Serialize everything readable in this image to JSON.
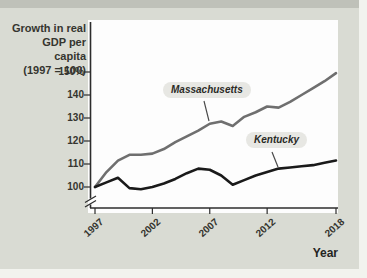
{
  "figure": {
    "y_axis_title": "Growth in real\nGDP per capita\n(1997 = 100)",
    "x_axis_title": "Year"
  },
  "colors": {
    "background": "#d9dbd3",
    "plot_background": "#fdfdfd",
    "axis": "#2d2d2d",
    "massachusetts_line": "#6f6f6f",
    "kentucky_line": "#1a1a1a",
    "label_pill_background": "#e7e7e3"
  },
  "chart_data": {
    "type": "line",
    "title": "Growth in real GDP per capita (1997 = 100)",
    "xlabel": "Year",
    "ylabel": "Growth in real GDP per capita (1997 = 100)",
    "grid": false,
    "legend": "inline-callout-labels",
    "axis_break_below_100": true,
    "ylim_shown": [
      96,
      152
    ],
    "x": [
      1997,
      1998,
      1999,
      2000,
      2001,
      2002,
      2003,
      2004,
      2005,
      2006,
      2007,
      2008,
      2009,
      2010,
      2011,
      2012,
      2013,
      2014,
      2015,
      2016,
      2017,
      2018
    ],
    "series": [
      {
        "name": "Massachusetts",
        "color": "#6f6f6f",
        "values": [
          100,
          106.5,
          111.5,
          114,
          114,
          114.5,
          116.5,
          119.5,
          122,
          124.5,
          127.5,
          128.5,
          126.5,
          130.5,
          132.5,
          135,
          134.5,
          137,
          140,
          143,
          146,
          149.5
        ]
      },
      {
        "name": "Kentucky",
        "color": "#1a1a1a",
        "values": [
          100,
          102,
          104,
          99.5,
          99,
          100,
          101.5,
          103.5,
          106,
          108,
          107.5,
          105,
          101,
          103,
          105,
          106.5,
          108,
          108.5,
          109,
          109.5,
          110.5,
          111.5
        ]
      }
    ],
    "y_ticks": [
      {
        "label": "150%",
        "value": 150
      },
      {
        "label": "140",
        "value": 140
      },
      {
        "label": "130",
        "value": 130
      },
      {
        "label": "120",
        "value": 120
      },
      {
        "label": "110",
        "value": 110
      },
      {
        "label": "100",
        "value": 100
      }
    ],
    "x_ticks": [
      {
        "label": "1997",
        "value": 1997
      },
      {
        "label": "2002",
        "value": 2002
      },
      {
        "label": "2007",
        "value": 2007
      },
      {
        "label": "2012",
        "value": 2012
      },
      {
        "label": "2018",
        "value": 2018
      }
    ]
  }
}
